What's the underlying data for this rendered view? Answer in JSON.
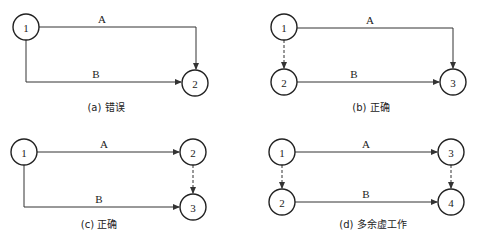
{
  "figure": {
    "panels": [
      {
        "id": "a",
        "caption": "(a) 错误",
        "caption_pos": [
          106,
          111
        ],
        "nodes": [
          {
            "label": "1",
            "x": 26,
            "y": 27
          },
          {
            "label": "2",
            "x": 195,
            "y": 83
          }
        ],
        "edges": [
          {
            "label": "A",
            "type": "solid",
            "path": "M39,27 L196,27 L196,69",
            "label_pos": [
              102,
              23
            ]
          },
          {
            "label": "B",
            "type": "solid",
            "path": "M26,40 L26,82 L181,82",
            "label_pos": [
              96,
              78
            ]
          }
        ]
      },
      {
        "id": "b",
        "caption": "(b) 正确",
        "caption_pos": [
          371,
          111
        ],
        "nodes": [
          {
            "label": "1",
            "x": 284,
            "y": 27
          },
          {
            "label": "2",
            "x": 284,
            "y": 82
          },
          {
            "label": "3",
            "x": 453,
            "y": 82
          }
        ],
        "edges": [
          {
            "label": "A",
            "type": "solid",
            "path": "M297,28 L453,28 L453,68",
            "label_pos": [
              370,
              24
            ]
          },
          {
            "label": "",
            "type": "dummy",
            "path": "M284,40 L284,68",
            "label_pos": [
              0,
              0
            ]
          },
          {
            "label": "B",
            "type": "solid",
            "path": "M297,82 L439,82",
            "label_pos": [
              354,
              78
            ]
          }
        ]
      },
      {
        "id": "c",
        "caption": "(c) 正确",
        "caption_pos": [
          99,
          228
        ],
        "nodes": [
          {
            "label": "1",
            "x": 24,
            "y": 152
          },
          {
            "label": "2",
            "x": 193,
            "y": 152
          },
          {
            "label": "3",
            "x": 193,
            "y": 207
          }
        ],
        "edges": [
          {
            "label": "A",
            "type": "solid",
            "path": "M37,152 L179,152",
            "label_pos": [
              104,
              148
            ]
          },
          {
            "label": "",
            "type": "dummy",
            "path": "M193,165 L193,193",
            "label_pos": [
              0,
              0
            ]
          },
          {
            "label": "B",
            "type": "solid",
            "path": "M24,165 L24,207 L179,207",
            "label_pos": [
              99,
              203
            ]
          }
        ]
      },
      {
        "id": "d",
        "caption": "(d) 多余虚工作",
        "caption_pos": [
          373,
          228
        ],
        "nodes": [
          {
            "label": "1",
            "x": 282,
            "y": 152
          },
          {
            "label": "2",
            "x": 282,
            "y": 202
          },
          {
            "label": "3",
            "x": 451,
            "y": 152
          },
          {
            "label": "4",
            "x": 451,
            "y": 202
          }
        ],
        "edges": [
          {
            "label": "A",
            "type": "solid",
            "path": "M295,152 L437,152",
            "label_pos": [
              366,
              148
            ]
          },
          {
            "label": "",
            "type": "dummy",
            "path": "M282,165 L282,188",
            "label_pos": [
              0,
              0
            ]
          },
          {
            "label": "",
            "type": "dummy",
            "path": "M451,165 L451,188",
            "label_pos": [
              0,
              0
            ]
          },
          {
            "label": "B",
            "type": "solid",
            "path": "M295,202 L437,202",
            "label_pos": [
              366,
              198
            ]
          }
        ]
      }
    ],
    "node_radius": 13,
    "colors": {
      "stroke": "#222222",
      "background": "#ffffff"
    }
  }
}
